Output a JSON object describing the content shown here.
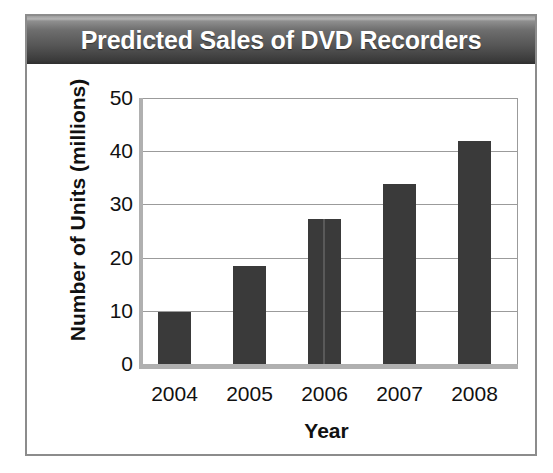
{
  "figure": {
    "title": "Predicted Sales of DVD Recorders"
  },
  "colors": {
    "bar": "#3a3a3a",
    "title_bar_dark": "#2e2e2e",
    "title_bar_light": "#b4b4b4",
    "gridline": "#9b9b9b",
    "axis": "#b0b0b0",
    "frame": "#8c8c8c",
    "title_text": "#ffffff"
  },
  "chart_data": {
    "type": "bar",
    "title": "Predicted Sales of DVD Recorders",
    "xlabel": "Year",
    "ylabel": "Number of Units (millions)",
    "categories": [
      "2004",
      "2005",
      "2006",
      "2007",
      "2008"
    ],
    "values": [
      9.7,
      18.4,
      27.3,
      33.8,
      42.0
    ],
    "ylim": [
      0,
      50
    ],
    "yticks": [
      0,
      10,
      20,
      30,
      40,
      50
    ],
    "ytick_labels": [
      "0",
      "10",
      "20",
      "30",
      "40",
      "50"
    ],
    "grid": true,
    "grid_axis": "y",
    "legend": false,
    "legend_position": "none",
    "bar_color": "#3a3a3a"
  }
}
